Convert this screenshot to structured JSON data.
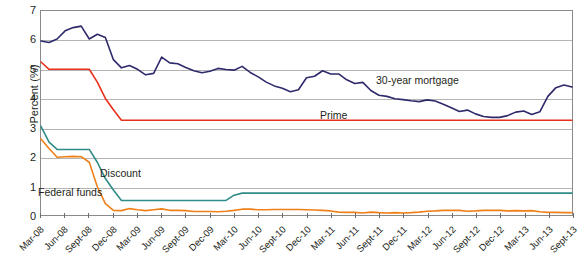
{
  "chart_data": {
    "type": "line",
    "title": "",
    "xlabel": "",
    "ylabel": "Percent (%)",
    "ylim": [
      0,
      7
    ],
    "yticks": [
      0,
      1,
      2,
      3,
      4,
      5,
      6,
      7
    ],
    "grid": true,
    "legend_position": "inline-annotations",
    "x": [
      "Mar-08",
      "Apr-08",
      "May-08",
      "Jun-08",
      "Jul-08",
      "Aug-08",
      "Sept-08",
      "Oct-08",
      "Nov-08",
      "Dec-08",
      "Jan-09",
      "Feb-09",
      "Mar-09",
      "Apr-09",
      "May-09",
      "Jun-09",
      "Jul-09",
      "Aug-09",
      "Sept-09",
      "Oct-09",
      "Nov-09",
      "Dec-09",
      "Jan-10",
      "Feb-10",
      "Mar-10",
      "Apr-10",
      "May-10",
      "Jun-10",
      "Jul-10",
      "Aug-10",
      "Sept-10",
      "Oct-10",
      "Nov-10",
      "Dec-10",
      "Jan-11",
      "Feb-11",
      "Mar-11",
      "Apr-11",
      "May-11",
      "Jun-11",
      "Jul-11",
      "Aug-11",
      "Sept-11",
      "Oct-11",
      "Nov-11",
      "Dec-11",
      "Jan-12",
      "Feb-12",
      "Mar-12",
      "Apr-12",
      "May-12",
      "Jun-12",
      "Jul-12",
      "Aug-12",
      "Sept-12",
      "Oct-12",
      "Nov-12",
      "Dec-12",
      "Jan-13",
      "Feb-13",
      "Mar-13",
      "Apr-13",
      "May-13",
      "Jun-13",
      "Jul-13",
      "Aug-13",
      "Sept-13"
    ],
    "xtick_labels": [
      "Mar-08",
      "Jun-08",
      "Sept-08",
      "Dec-08",
      "Mar-09",
      "Jun-09",
      "Sept-09",
      "Dec-09",
      "Mar-10",
      "Jun-10",
      "Sept-10",
      "Dec-10",
      "Mar-11",
      "Jun-11",
      "Sept-11",
      "Dec-11",
      "Mar-12",
      "Jun-12",
      "Sept-12",
      "Dec-12",
      "Mar-13",
      "Jun-13",
      "Sept-13"
    ],
    "series": [
      {
        "name": "30-year mortgage",
        "color": "#2e2a6b",
        "label_text": "30-year mortgage",
        "values": [
          5.97,
          5.92,
          6.04,
          6.32,
          6.43,
          6.48,
          6.04,
          6.2,
          6.09,
          5.33,
          5.05,
          5.13,
          5.0,
          4.81,
          4.86,
          5.42,
          5.22,
          5.19,
          5.06,
          4.95,
          4.88,
          4.93,
          5.03,
          4.99,
          4.97,
          5.1,
          4.89,
          4.74,
          4.56,
          4.43,
          4.35,
          4.23,
          4.3,
          4.71,
          4.76,
          4.95,
          4.84,
          4.84,
          4.64,
          4.51,
          4.55,
          4.27,
          4.11,
          4.07,
          3.99,
          3.96,
          3.92,
          3.89,
          3.95,
          3.91,
          3.8,
          3.68,
          3.55,
          3.6,
          3.47,
          3.38,
          3.35,
          3.35,
          3.41,
          3.53,
          3.57,
          3.45,
          3.54,
          4.07,
          4.37,
          4.46,
          4.39
        ]
      },
      {
        "name": "Prime",
        "color": "#e8301c",
        "label_text": "Prime",
        "values": [
          5.25,
          5.0,
          5.0,
          5.0,
          5.0,
          5.0,
          5.0,
          4.56,
          4.0,
          3.61,
          3.25,
          3.25,
          3.25,
          3.25,
          3.25,
          3.25,
          3.25,
          3.25,
          3.25,
          3.25,
          3.25,
          3.25,
          3.25,
          3.25,
          3.25,
          3.25,
          3.25,
          3.25,
          3.25,
          3.25,
          3.25,
          3.25,
          3.25,
          3.25,
          3.25,
          3.25,
          3.25,
          3.25,
          3.25,
          3.25,
          3.25,
          3.25,
          3.25,
          3.25,
          3.25,
          3.25,
          3.25,
          3.25,
          3.25,
          3.25,
          3.25,
          3.25,
          3.25,
          3.25,
          3.25,
          3.25,
          3.25,
          3.25,
          3.25,
          3.25,
          3.25,
          3.25,
          3.25,
          3.25,
          3.25,
          3.25,
          3.25
        ]
      },
      {
        "name": "Discount",
        "color": "#2f8c86",
        "label_text": "Discount",
        "values": [
          3.04,
          2.5,
          2.25,
          2.25,
          2.25,
          2.25,
          2.25,
          1.81,
          1.25,
          0.86,
          0.5,
          0.5,
          0.5,
          0.5,
          0.5,
          0.5,
          0.5,
          0.5,
          0.5,
          0.5,
          0.5,
          0.5,
          0.5,
          0.5,
          0.68,
          0.75,
          0.75,
          0.75,
          0.75,
          0.75,
          0.75,
          0.75,
          0.75,
          0.75,
          0.75,
          0.75,
          0.75,
          0.75,
          0.75,
          0.75,
          0.75,
          0.75,
          0.75,
          0.75,
          0.75,
          0.75,
          0.75,
          0.75,
          0.75,
          0.75,
          0.75,
          0.75,
          0.75,
          0.75,
          0.75,
          0.75,
          0.75,
          0.75,
          0.75,
          0.75,
          0.75,
          0.75,
          0.75,
          0.75,
          0.75,
          0.75,
          0.75
        ]
      },
      {
        "name": "Federal funds",
        "color": "#ef8019",
        "label_text": "Federal funds",
        "values": [
          2.61,
          2.28,
          1.98,
          2.0,
          2.01,
          2.0,
          1.81,
          0.97,
          0.39,
          0.16,
          0.15,
          0.22,
          0.18,
          0.15,
          0.18,
          0.21,
          0.16,
          0.16,
          0.15,
          0.12,
          0.12,
          0.12,
          0.11,
          0.13,
          0.16,
          0.2,
          0.2,
          0.18,
          0.18,
          0.19,
          0.19,
          0.19,
          0.19,
          0.18,
          0.17,
          0.16,
          0.14,
          0.1,
          0.09,
          0.09,
          0.07,
          0.1,
          0.08,
          0.07,
          0.08,
          0.07,
          0.08,
          0.1,
          0.13,
          0.14,
          0.16,
          0.16,
          0.16,
          0.13,
          0.14,
          0.16,
          0.16,
          0.16,
          0.14,
          0.15,
          0.14,
          0.15,
          0.11,
          0.09,
          0.09,
          0.08,
          0.08
        ]
      }
    ],
    "annotations": [
      {
        "text": "30-year mortgage",
        "series": "30-year mortgage"
      },
      {
        "text": "Prime",
        "series": "Prime"
      },
      {
        "text": "Discount",
        "series": "Discount"
      },
      {
        "text": "Federal funds",
        "series": "Federal funds"
      }
    ]
  }
}
